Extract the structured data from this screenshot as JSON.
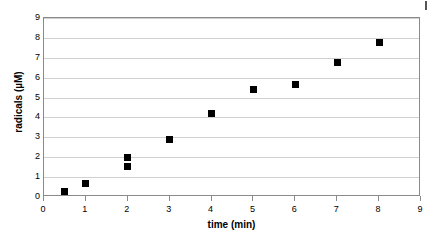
{
  "chart_data": {
    "type": "scatter",
    "title": "",
    "xlabel": "time (min)",
    "ylabel": "radicals (µM)",
    "xlim": [
      0,
      9
    ],
    "ylim": [
      0,
      9
    ],
    "xticks": [
      0,
      1,
      2,
      3,
      4,
      5,
      6,
      7,
      8,
      9
    ],
    "yticks": [
      0,
      1,
      2,
      3,
      4,
      5,
      6,
      7,
      8,
      9
    ],
    "xtick_labels": [
      "0",
      "1",
      "2",
      "3",
      "4",
      "5",
      "6",
      "7",
      "8",
      "9"
    ],
    "ytick_labels": [
      "0",
      "1",
      "2",
      "3",
      "4",
      "5",
      "6",
      "7",
      "8",
      "9"
    ],
    "grid": {
      "horizontal": true,
      "vertical": false,
      "color": "#d0d0d0"
    },
    "legend": null,
    "marker": {
      "shape": "square",
      "color": "#000000",
      "size_px": 7
    },
    "series": [
      {
        "name": "radicals",
        "points": [
          {
            "x": 0.5,
            "y": 0.3
          },
          {
            "x": 1.0,
            "y": 0.7
          },
          {
            "x": 2.0,
            "y": 2.0
          },
          {
            "x": 2.0,
            "y": 1.55
          },
          {
            "x": 3.0,
            "y": 2.9
          },
          {
            "x": 4.0,
            "y": 4.2
          },
          {
            "x": 5.0,
            "y": 5.4
          },
          {
            "x": 6.0,
            "y": 5.65
          },
          {
            "x": 7.0,
            "y": 6.75
          },
          {
            "x": 8.0,
            "y": 7.75
          }
        ]
      }
    ]
  },
  "figure": {
    "background_color": "#ffffff",
    "frame_color": "#8a8a8a"
  }
}
